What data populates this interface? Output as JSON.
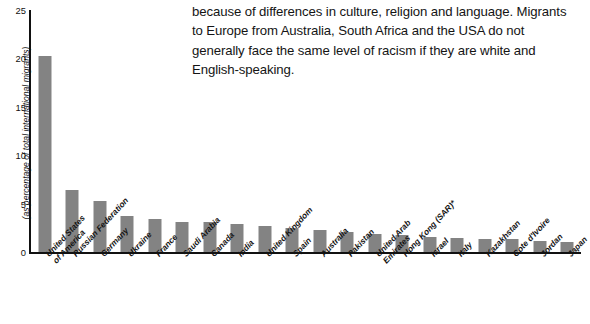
{
  "body_text": {
    "paragraph": "because of differences in culture, religion and language. Migrants to Europe from Australia, South Africa and the USA do not generally face the same level of racism if they are white and English-speaking."
  },
  "chart_data": {
    "type": "bar",
    "title": "",
    "xlabel": "",
    "ylabel": "(as percentage of total international migrants)",
    "ylim": [
      0,
      25
    ],
    "yticks": [
      0,
      5,
      10,
      15,
      20,
      25
    ],
    "grid": false,
    "legend": null,
    "bar_color": "#838383",
    "axis_color": "#111111",
    "categories": [
      "United States\nof America",
      "Russian Federation",
      "Germany",
      "Ukraine",
      "France",
      "Saudi Arabia",
      "Canada",
      "India",
      "United Kingdom",
      "Spain",
      "Australia",
      "Pakistan",
      "United Arab\nEmirates",
      "Hong Kong (SAR)*",
      "Israel",
      "Italy",
      "Kazakhstan",
      "Cote d'Ivoire",
      "Jordan",
      "Japan"
    ],
    "values": [
      20.2,
      6.4,
      5.3,
      3.7,
      3.4,
      3.1,
      3.1,
      2.9,
      2.7,
      2.5,
      2.3,
      2.1,
      1.9,
      1.8,
      1.5,
      1.4,
      1.3,
      1.3,
      1.1,
      1.0
    ]
  }
}
